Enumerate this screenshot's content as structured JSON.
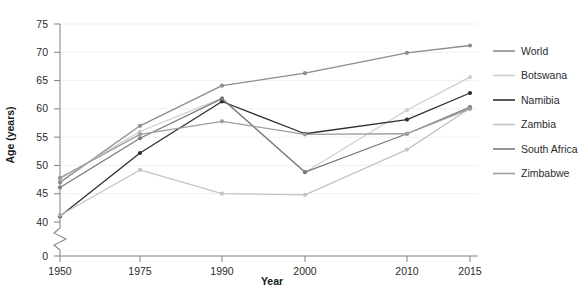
{
  "chart_data": {
    "type": "line",
    "title": "",
    "xlabel": "Year",
    "ylabel": "Age (years)",
    "x": [
      1950,
      1975,
      1990,
      2000,
      2010,
      2015
    ],
    "x_tick_labels": [
      "1950",
      "1975",
      "1990",
      "2000",
      "2010",
      "2015"
    ],
    "y_tick_labels": [
      "0",
      "40",
      "45",
      "50",
      "55",
      "60",
      "65",
      "70",
      "75"
    ],
    "ylim": [
      40,
      75
    ],
    "y_axis_break": true,
    "y_axis_break_note": "axis broken between 0 and 40",
    "grid": true,
    "grid_axis": "y",
    "legend_position": "right",
    "series": [
      {
        "name": "World",
        "color": "#8c8c8c",
        "values": [
          47.0,
          57.0,
          64.1,
          66.3,
          69.9,
          71.2
        ]
      },
      {
        "name": "Botswana",
        "color": "#cfcfcf",
        "values": [
          47.6,
          56.0,
          61.9,
          48.8,
          59.8,
          65.6
        ]
      },
      {
        "name": "Namibia",
        "color": "#2e2e2e",
        "values": [
          41.0,
          52.2,
          61.3,
          55.6,
          58.1,
          62.8
        ]
      },
      {
        "name": "Zambia",
        "color": "#c4c4c4",
        "values": [
          41.2,
          49.2,
          45.0,
          44.8,
          52.8,
          60.1
        ]
      },
      {
        "name": "South Africa",
        "color": "#7a7a7a",
        "values": [
          46.1,
          54.8,
          61.8,
          48.8,
          55.6,
          60.3
        ]
      },
      {
        "name": "Zimbabwe",
        "color": "#9e9e9e",
        "values": [
          47.8,
          55.5,
          57.8,
          55.5,
          55.6,
          60.0
        ]
      }
    ]
  },
  "axis": {
    "x_title": "Year",
    "y_title": "Age (years)"
  },
  "legend": {
    "items": [
      {
        "label": "World"
      },
      {
        "label": "Botswana"
      },
      {
        "label": "Namibia"
      },
      {
        "label": "Zambia"
      },
      {
        "label": "South Africa"
      },
      {
        "label": "Zimbabwe"
      }
    ]
  }
}
